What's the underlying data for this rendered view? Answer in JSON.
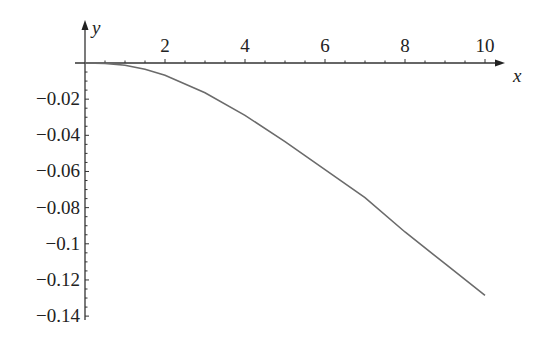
{
  "chart_data": {
    "type": "line",
    "title": "",
    "xlabel": "x",
    "ylabel": "y",
    "xlim": [
      0,
      10.2
    ],
    "ylim": [
      -0.14,
      0
    ],
    "grid": false,
    "x_ticks": [
      2,
      4,
      6,
      8,
      10
    ],
    "x_tick_labels": [
      "2",
      "4",
      "6",
      "8",
      "10"
    ],
    "y_ticks": [
      -0.02,
      -0.04,
      -0.06,
      -0.08,
      -0.1,
      -0.12,
      -0.14
    ],
    "y_tick_labels": [
      "−0.02",
      "−0.04",
      "−0.06",
      "−0.08",
      "−0.1",
      "−0.12",
      "−0.14"
    ],
    "series": [
      {
        "name": "y(x)",
        "color": "#6b6b6b",
        "x": [
          0,
          0.5,
          1,
          1.5,
          2,
          3,
          4,
          5,
          6,
          7,
          8,
          9,
          10
        ],
        "y": [
          0,
          -0.0002,
          -0.0012,
          -0.0035,
          -0.0068,
          -0.0165,
          -0.029,
          -0.0435,
          -0.059,
          -0.0745,
          -0.0935,
          -0.111,
          -0.1285
        ]
      }
    ]
  }
}
